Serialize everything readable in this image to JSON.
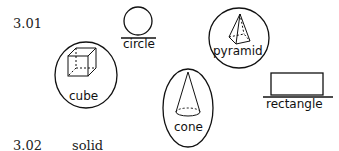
{
  "items": [
    {
      "number": "3.01"
    },
    {
      "number": "3.02",
      "answer": "solid"
    }
  ],
  "shapes": {
    "circle": {
      "label": "circle",
      "circled": false
    },
    "cube": {
      "label": "cube",
      "circled": true
    },
    "pyramid": {
      "label": "pyramid",
      "circled": true
    },
    "cone": {
      "label": "cone",
      "circled": true
    },
    "rectangle": {
      "label": "rectangle",
      "circled": false
    }
  }
}
